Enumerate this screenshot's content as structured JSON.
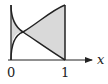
{
  "figure": {
    "axis_label_x": "x",
    "tick_labels": [
      "0",
      "1"
    ],
    "curves": [
      {
        "name": "increasing-curve",
        "shape": "concave rising from (0,0) to (1,1)"
      },
      {
        "name": "decreasing-curve",
        "shape": "convex falling from (0,1) to (1,0)"
      }
    ],
    "shading_color": "#d9d9d9",
    "line_color": "#222222"
  }
}
